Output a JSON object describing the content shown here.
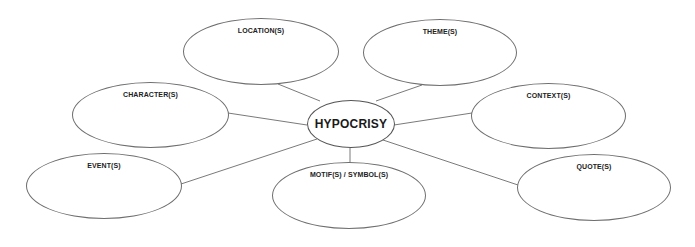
{
  "diagram": {
    "type": "mind-map / spider diagram",
    "center": {
      "label": "HYPOCRISY",
      "x": 307,
      "y": 100,
      "w": 88,
      "h": 48
    },
    "nodes": [
      {
        "id": "location",
        "label": "LOCATION(S)",
        "x": 183,
        "y": 18,
        "w": 156,
        "h": 67,
        "line": [
          278,
          84,
          320,
          101
        ]
      },
      {
        "id": "theme",
        "label": "THEME(S)",
        "x": 363,
        "y": 19,
        "w": 154,
        "h": 67,
        "line": [
          422,
          85,
          376,
          101
        ]
      },
      {
        "id": "character",
        "label": "CHARACTER(S)",
        "x": 72,
        "y": 82,
        "w": 157,
        "h": 66,
        "line": [
          228,
          113,
          307,
          125
        ]
      },
      {
        "id": "context",
        "label": "CONTEXT(S)",
        "x": 471,
        "y": 83,
        "w": 155,
        "h": 66,
        "line": [
          472,
          113,
          394,
          125
        ]
      },
      {
        "id": "event",
        "label": "EVENT(S)",
        "x": 26,
        "y": 153,
        "w": 156,
        "h": 66,
        "line": [
          181,
          184,
          317,
          139
        ]
      },
      {
        "id": "motif",
        "label": "MOTIF(S) / SYMBOL(S)",
        "x": 272,
        "y": 162,
        "w": 154,
        "h": 67,
        "line": [
          350,
          148,
          350,
          163
        ]
      },
      {
        "id": "quote",
        "label": "QUOTE(S)",
        "x": 517,
        "y": 154,
        "w": 154,
        "h": 67,
        "line": [
          383,
          140,
          518,
          185
        ]
      }
    ],
    "colors": {
      "background": "#ffffff",
      "outline": "#6e6e6e",
      "connector": "#7a7a7a",
      "text": "#222222"
    }
  }
}
